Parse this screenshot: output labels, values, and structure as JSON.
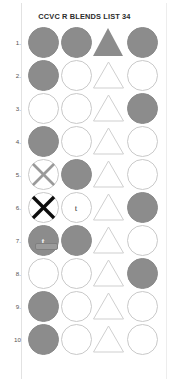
{
  "document": {
    "title": "CCVC R BLENDS LIST 34"
  },
  "worksheet": {
    "column_count": 4,
    "colors": {
      "shape_fill": "#8c8c8c",
      "shape_outline": "#c9c9c9",
      "mark_black": "#0d0d0d",
      "mark_grey": "#9a9a9a",
      "title_text": "#2b2b2b"
    },
    "rows": [
      {
        "number": "1.",
        "cells": [
          {
            "shape": "circle",
            "fill": "filled",
            "mark": null,
            "letter": null
          },
          {
            "shape": "circle",
            "fill": "filled",
            "mark": null,
            "letter": null
          },
          {
            "shape": "triangle",
            "fill": "filled",
            "mark": null,
            "letter": null
          },
          {
            "shape": "circle",
            "fill": "filled",
            "mark": null,
            "letter": null
          }
        ]
      },
      {
        "number": "2.",
        "cells": [
          {
            "shape": "circle",
            "fill": "filled",
            "mark": null,
            "letter": null
          },
          {
            "shape": "circle",
            "fill": "empty",
            "mark": null,
            "letter": null
          },
          {
            "shape": "triangle",
            "fill": "empty",
            "mark": null,
            "letter": null
          },
          {
            "shape": "circle",
            "fill": "empty",
            "mark": null,
            "letter": null
          }
        ]
      },
      {
        "number": "3.",
        "cells": [
          {
            "shape": "circle",
            "fill": "empty",
            "mark": null,
            "letter": null
          },
          {
            "shape": "circle",
            "fill": "empty",
            "mark": null,
            "letter": null
          },
          {
            "shape": "triangle",
            "fill": "empty",
            "mark": null,
            "letter": null
          },
          {
            "shape": "circle",
            "fill": "filled",
            "mark": null,
            "letter": null
          }
        ]
      },
      {
        "number": "4.",
        "cells": [
          {
            "shape": "circle",
            "fill": "filled",
            "mark": null,
            "letter": null
          },
          {
            "shape": "circle",
            "fill": "empty",
            "mark": null,
            "letter": null
          },
          {
            "shape": "triangle",
            "fill": "empty",
            "mark": null,
            "letter": null
          },
          {
            "shape": "circle",
            "fill": "empty",
            "mark": null,
            "letter": null
          }
        ]
      },
      {
        "number": "5.",
        "cells": [
          {
            "shape": "circle",
            "fill": "empty",
            "mark": "x-grey",
            "letter": null
          },
          {
            "shape": "circle",
            "fill": "filled",
            "mark": null,
            "letter": null
          },
          {
            "shape": "triangle",
            "fill": "empty",
            "mark": null,
            "letter": null
          },
          {
            "shape": "circle",
            "fill": "empty",
            "mark": null,
            "letter": null
          }
        ]
      },
      {
        "number": "6.",
        "cells": [
          {
            "shape": "circle",
            "fill": "empty",
            "mark": "x-black",
            "letter": null
          },
          {
            "shape": "circle",
            "fill": "empty",
            "mark": null,
            "letter": "t"
          },
          {
            "shape": "triangle",
            "fill": "empty",
            "mark": null,
            "letter": null
          },
          {
            "shape": "circle",
            "fill": "filled",
            "mark": null,
            "letter": null
          }
        ]
      },
      {
        "number": "7.",
        "cells": [
          {
            "shape": "circle",
            "fill": "filled",
            "mark": "tooltip",
            "letter": "t"
          },
          {
            "shape": "circle",
            "fill": "filled",
            "mark": null,
            "letter": null
          },
          {
            "shape": "triangle",
            "fill": "empty",
            "mark": null,
            "letter": null
          },
          {
            "shape": "circle",
            "fill": "empty",
            "mark": null,
            "letter": null
          }
        ]
      },
      {
        "number": "8.",
        "cells": [
          {
            "shape": "circle",
            "fill": "empty",
            "mark": null,
            "letter": null
          },
          {
            "shape": "circle",
            "fill": "empty",
            "mark": null,
            "letter": null
          },
          {
            "shape": "triangle",
            "fill": "empty",
            "mark": null,
            "letter": null
          },
          {
            "shape": "circle",
            "fill": "filled",
            "mark": null,
            "letter": null
          }
        ]
      },
      {
        "number": "9.",
        "cells": [
          {
            "shape": "circle",
            "fill": "filled",
            "mark": null,
            "letter": null
          },
          {
            "shape": "circle",
            "fill": "empty",
            "mark": null,
            "letter": null
          },
          {
            "shape": "triangle",
            "fill": "empty",
            "mark": null,
            "letter": null
          },
          {
            "shape": "circle",
            "fill": "empty",
            "mark": null,
            "letter": null
          }
        ]
      },
      {
        "number": "10",
        "cells": [
          {
            "shape": "circle",
            "fill": "filled",
            "mark": null,
            "letter": null
          },
          {
            "shape": "circle",
            "fill": "empty",
            "mark": null,
            "letter": null
          },
          {
            "shape": "triangle",
            "fill": "empty",
            "mark": null,
            "letter": null
          },
          {
            "shape": "circle",
            "fill": "empty",
            "mark": null,
            "letter": null
          }
        ]
      }
    ]
  }
}
